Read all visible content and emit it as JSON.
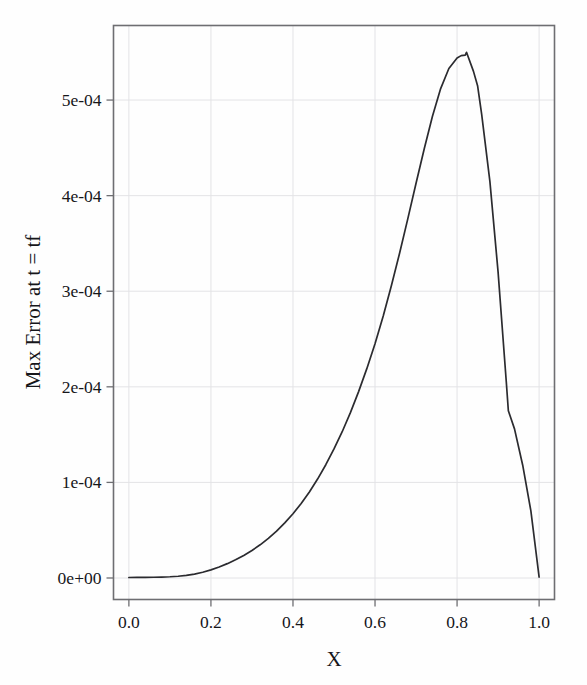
{
  "figure": {
    "background_color": "#fefefe",
    "frame_color": "#6e6e72",
    "grid_color": "#e3e3e6",
    "line_color": "#2b2b2f"
  },
  "chart_data": {
    "type": "line",
    "title": "",
    "xlabel": "X",
    "ylabel": "Max Error at t = tf",
    "xlim": [
      -0.0375,
      1.0375
    ],
    "ylim": [
      -2.25e-05,
      0.000578
    ],
    "grid": true,
    "legend": null,
    "xticks": [
      0.0,
      0.2,
      0.4,
      0.6,
      0.8,
      1.0
    ],
    "xticklabels": [
      "0.0",
      "0.2",
      "0.4",
      "0.6",
      "0.8",
      "1.0"
    ],
    "yticks": [
      0.0,
      0.0001,
      0.0002,
      0.0003,
      0.0004,
      0.0005
    ],
    "yticklabels": [
      "0e+00",
      "1e-04",
      "2e-04",
      "3e-04",
      "4e-04",
      "5e-04"
    ],
    "series": [
      {
        "name": "max error",
        "x": [
          0.0,
          0.02,
          0.04,
          0.06,
          0.08,
          0.1,
          0.12,
          0.14,
          0.16,
          0.18,
          0.2,
          0.22,
          0.24,
          0.26,
          0.28,
          0.3,
          0.32,
          0.34,
          0.36,
          0.38,
          0.4,
          0.42,
          0.44,
          0.46,
          0.48,
          0.5,
          0.52,
          0.54,
          0.56,
          0.58,
          0.6,
          0.62,
          0.64,
          0.66,
          0.68,
          0.7,
          0.72,
          0.74,
          0.76,
          0.78,
          0.8,
          0.81,
          0.82,
          0.823,
          0.84,
          0.85,
          0.86,
          0.88,
          0.9,
          0.92,
          0.925,
          0.94,
          0.96,
          0.98,
          1.0
        ],
        "y": [
          5e-07,
          6e-07,
          7e-07,
          8e-07,
          1e-06,
          1.3e-06,
          1.8e-06,
          2.7e-06,
          4.1e-06,
          6e-06,
          8.5e-06,
          1.15e-05,
          1.5e-05,
          1.9e-05,
          2.36e-05,
          2.88e-05,
          3.47e-05,
          4.14e-05,
          4.9e-05,
          5.76e-05,
          6.72e-05,
          7.8e-05,
          9e-05,
          0.0001035,
          0.0001185,
          0.000135,
          0.000153,
          0.000173,
          0.000195,
          0.000219,
          0.000245,
          0.000274,
          0.000306,
          0.00034,
          0.000376,
          0.000413,
          0.000449,
          0.000483,
          0.000512,
          0.000533,
          0.000544,
          0.0005465,
          0.000547,
          0.00055,
          0.00053,
          0.000515,
          0.000485,
          0.000415,
          0.00032,
          0.000205,
          0.000175,
          0.000156,
          0.000118,
          7e-05,
          1e-06
        ]
      }
    ]
  }
}
